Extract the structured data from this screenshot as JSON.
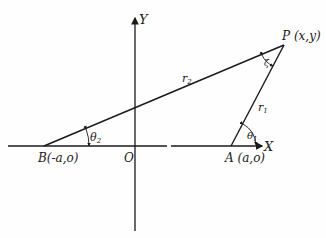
{
  "diagram": {
    "axes": {
      "x_label": "X",
      "y_label": "Y",
      "origin_label": "O"
    },
    "points": {
      "P": {
        "label": "P (x,y)"
      },
      "A": {
        "label": "A (a,o)"
      },
      "B": {
        "label": "B(-a,o)"
      }
    },
    "segments": {
      "r1": {
        "label": "r",
        "sub": "1"
      },
      "r2": {
        "label": "r",
        "sub": "2"
      }
    },
    "angles": {
      "theta1": {
        "label": "θ",
        "sub": "1"
      },
      "theta2": {
        "label": "θ",
        "sub": "2"
      },
      "zeta": {
        "label": "ζ"
      }
    },
    "colors": {
      "ink": "#1a1a1a",
      "background": "#fefefe"
    }
  }
}
